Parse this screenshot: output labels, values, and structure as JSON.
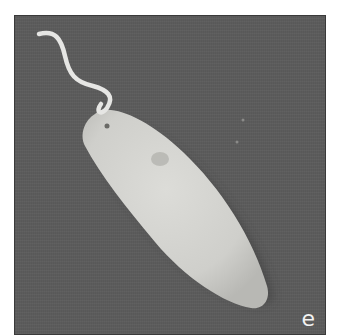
{
  "figure": {
    "panel_label": "e",
    "colors": {
      "background": "#5c5c5c",
      "cell_body": "#d4d4d0",
      "flagellum": "#e6e6e4",
      "label": "#f2f2f2"
    }
  }
}
